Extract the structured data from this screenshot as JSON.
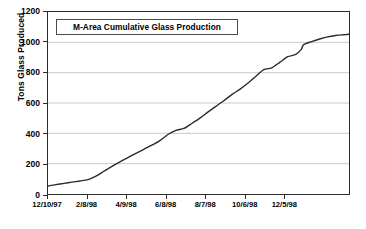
{
  "chart_data": {
    "type": "line",
    "title": "M-Area Cumulative Glass Production",
    "xlabel": "",
    "ylabel": "Tons Glass Produced",
    "ylim": [
      0,
      1200
    ],
    "yticks": [
      0,
      200,
      400,
      600,
      800,
      1000,
      1200
    ],
    "ytick_labels": [
      "0",
      "200",
      "400",
      "600",
      "800",
      "1000",
      "1200"
    ],
    "xtick_labels": [
      "12/10/97",
      "2/8/98",
      "4/9/98",
      "6/8/98",
      "8/7/98",
      "10/6/98",
      "12/5/98"
    ],
    "xlim": [
      "12/10/97",
      "12/25/98"
    ],
    "grid": "horizontal",
    "legend": "none",
    "line_color": "#2b2b2b",
    "series": [
      {
        "name": "Cumulative Glass Produced",
        "x_days": [
          0,
          12,
          24,
          36,
          48,
          60,
          72,
          84,
          96,
          108,
          120,
          132,
          144,
          156,
          168,
          180,
          192,
          204,
          216,
          228,
          240,
          252,
          264,
          276,
          288,
          300,
          312,
          324,
          336,
          348,
          360,
          372,
          380
        ],
        "x_dates": [
          "12/10/97",
          "12/22/97",
          "1/3/98",
          "1/15/98",
          "1/27/98",
          "2/8/98",
          "2/20/98",
          "3/4/98",
          "3/16/98",
          "3/28/98",
          "4/9/98",
          "4/21/98",
          "5/3/98",
          "5/15/98",
          "5/27/98",
          "6/8/98",
          "6/20/98",
          "7/2/98",
          "7/14/98",
          "7/26/98",
          "8/7/98",
          "8/19/98",
          "8/31/98",
          "9/12/98",
          "9/24/98",
          "10/6/98",
          "10/18/98",
          "10/30/98",
          "11/11/98",
          "11/23/98",
          "12/5/98",
          "12/17/98",
          "12/25/98"
        ],
        "values": [
          52,
          62,
          70,
          78,
          86,
          95,
          118,
          150,
          182,
          212,
          240,
          268,
          295,
          322,
          352,
          392,
          420,
          432,
          465,
          500,
          540,
          578,
          615,
          655,
          690,
          730,
          775,
          820,
          832,
          868,
          905,
          920,
          952
        ]
      }
    ],
    "values_extended": {
      "note": "curve continues flattening toward the right edge",
      "tail_x_days": [
        372,
        384,
        396,
        408,
        420,
        432,
        444,
        452
      ],
      "tail_values": [
        965,
        985,
        1005,
        1022,
        1036,
        1045,
        1050,
        1053
      ]
    }
  }
}
